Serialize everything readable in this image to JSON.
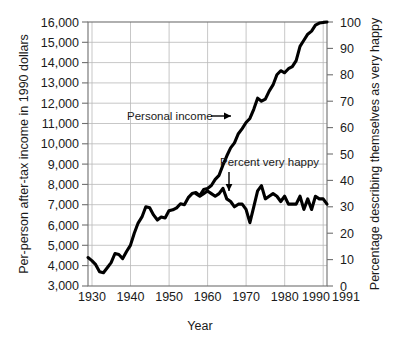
{
  "chart_data": {
    "type": "line",
    "title": "",
    "xlabel": "Year",
    "ylabel": "Per-person after-tax income in 1990 dollars",
    "y2label": "Percentage describing themselves as very happy",
    "xlim": [
      1929,
      1991
    ],
    "ylim": [
      3000,
      16000
    ],
    "y2lim": [
      0,
      100
    ],
    "grid": true,
    "legend": "annotations-inline",
    "xticks": [
      "1930",
      "1940",
      "1950",
      "1960",
      "1970",
      "1980",
      "1990",
      "1991"
    ],
    "xtick_values": [
      1930,
      1940,
      1950,
      1960,
      1970,
      1980,
      1990,
      1991
    ],
    "yticks": [
      "3,000",
      "4,000",
      "5,000",
      "6,000",
      "7,000",
      "8,000",
      "9,000",
      "10,000",
      "11,000",
      "12,000",
      "13,000",
      "14,000",
      "15,000",
      "16,000"
    ],
    "ytick_values": [
      3000,
      4000,
      5000,
      6000,
      7000,
      8000,
      9000,
      10000,
      11000,
      12000,
      13000,
      14000,
      15000,
      16000
    ],
    "y2ticks": [
      "0",
      "10",
      "20",
      "30",
      "40",
      "50",
      "60",
      "70",
      "80",
      "90",
      "100"
    ],
    "y2tick_values": [
      0,
      10,
      20,
      30,
      40,
      50,
      60,
      70,
      80,
      90,
      100
    ],
    "annotations": [
      {
        "name": "personal-income",
        "text": "Personal income",
        "arrow": "right"
      },
      {
        "name": "percent-very-happy",
        "text": "Percent very happy",
        "arrow": "down"
      }
    ],
    "series": [
      {
        "name": "Personal income",
        "axis": "left",
        "units": "1990 dollars",
        "color": "#000000",
        "x": [
          1929,
          1930,
          1931,
          1932,
          1933,
          1934,
          1935,
          1936,
          1937,
          1938,
          1939,
          1940,
          1941,
          1942,
          1943,
          1944,
          1945,
          1946,
          1947,
          1948,
          1949,
          1950,
          1951,
          1952,
          1953,
          1954,
          1955,
          1956,
          1957,
          1958,
          1959,
          1960,
          1961,
          1962,
          1963,
          1964,
          1965,
          1966,
          1967,
          1968,
          1969,
          1970,
          1971,
          1972,
          1973,
          1974,
          1975,
          1976,
          1977,
          1978,
          1979,
          1980,
          1981,
          1982,
          1983,
          1984,
          1985,
          1986,
          1987,
          1988,
          1989,
          1990,
          1991
        ],
        "values": [
          4400,
          4250,
          4050,
          3700,
          3650,
          3900,
          4150,
          4600,
          4550,
          4350,
          4700,
          5000,
          5600,
          6100,
          6400,
          6900,
          6850,
          6500,
          6250,
          6400,
          6350,
          6700,
          6750,
          6850,
          7050,
          7000,
          7350,
          7550,
          7600,
          7450,
          7750,
          7800,
          7950,
          8250,
          8450,
          8950,
          9400,
          9800,
          10050,
          10500,
          10750,
          11050,
          11250,
          11700,
          12250,
          12100,
          12200,
          12600,
          12900,
          13400,
          13600,
          13500,
          13700,
          13800,
          14100,
          14800,
          15100,
          15400,
          15550,
          15850,
          15950,
          15980,
          16000
        ]
      },
      {
        "name": "Percent very happy",
        "axis": "right",
        "units": "percent",
        "color": "#000000",
        "x": [
          1957,
          1958,
          1959,
          1960,
          1961,
          1962,
          1963,
          1964,
          1965,
          1966,
          1967,
          1968,
          1969,
          1970,
          1971,
          1972,
          1973,
          1974,
          1975,
          1976,
          1977,
          1978,
          1979,
          1980,
          1981,
          1982,
          1983,
          1984,
          1985,
          1986,
          1987,
          1988,
          1989,
          1990,
          1991
        ],
        "values": [
          35,
          34,
          35,
          36,
          35,
          34,
          35,
          37,
          33,
          32,
          30,
          31,
          31,
          29,
          24,
          30,
          36,
          38,
          33,
          34,
          35,
          34,
          32,
          34,
          31,
          31,
          31,
          34,
          29,
          33,
          29,
          34,
          33,
          33,
          31
        ]
      }
    ]
  }
}
